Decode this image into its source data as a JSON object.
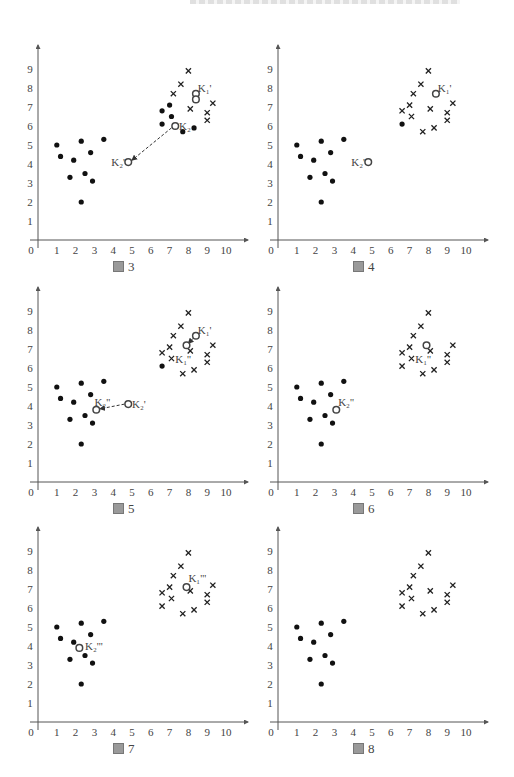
{
  "page": {
    "header_clipped": true
  },
  "panels": [
    {
      "id": "fig3",
      "caption_prefix": "圖",
      "caption_number": "3"
    },
    {
      "id": "fig4",
      "caption_prefix": "圖",
      "caption_number": "4"
    },
    {
      "id": "fig5",
      "caption_prefix": "圖",
      "caption_number": "5"
    },
    {
      "id": "fig6",
      "caption_prefix": "圖",
      "caption_number": "6"
    },
    {
      "id": "fig7",
      "caption_prefix": "圖",
      "caption_number": "7"
    },
    {
      "id": "fig8",
      "caption_prefix": "圖",
      "caption_number": "8"
    }
  ],
  "chart_data": [
    {
      "type": "scatter",
      "title": "圖 3",
      "xlabel": "",
      "ylabel": "",
      "xlim": [
        0,
        11
      ],
      "ylim": [
        0,
        10
      ],
      "x_ticks": [
        "0",
        "1",
        "2",
        "3",
        "4",
        "5",
        "6",
        "7",
        "8",
        "9",
        "10"
      ],
      "y_ticks": [
        "1",
        "2",
        "3",
        "4",
        "5",
        "6",
        "7",
        "8",
        "9"
      ],
      "grid": false,
      "series": [
        {
          "name": "cluster-2 (dot)",
          "marker": "dot",
          "points": [
            [
              1,
              5
            ],
            [
              1.2,
              4.4
            ],
            [
              1.7,
              3.3
            ],
            [
              1.9,
              4.2
            ],
            [
              2.3,
              5.2
            ],
            [
              2.3,
              2
            ],
            [
              2.5,
              3.5
            ],
            [
              2.8,
              4.6
            ],
            [
              2.9,
              3.1
            ],
            [
              3.5,
              5.3
            ],
            [
              6.6,
              6.8
            ],
            [
              6.6,
              6.1
            ],
            [
              7.0,
              7.1
            ],
            [
              7.1,
              6.5
            ],
            [
              7.7,
              5.7
            ],
            [
              8.3,
              5.9
            ]
          ]
        },
        {
          "name": "cluster-1 (cross)",
          "marker": "cross",
          "points": [
            [
              7.2,
              7.7
            ],
            [
              7.6,
              8.2
            ],
            [
              8.0,
              8.9
            ],
            [
              8.1,
              6.9
            ],
            [
              9.0,
              6.7
            ],
            [
              9.0,
              6.3
            ],
            [
              9.3,
              7.2
            ]
          ]
        },
        {
          "name": "centroids",
          "marker": "circle",
          "points": [
            [
              8.4,
              7.7
            ],
            [
              8.4,
              7.4
            ],
            [
              7.3,
              6.0
            ],
            [
              4.8,
              4.1
            ]
          ]
        }
      ],
      "annotations": [
        {
          "text": "K₁'",
          "at": [
            8.5,
            8.0
          ]
        },
        {
          "text": "K₂",
          "at": [
            7.5,
            6.0
          ]
        },
        {
          "text": "K₂'",
          "at": [
            3.9,
            4.1
          ]
        }
      ],
      "arrows": [
        {
          "from": [
            7.1,
            5.9
          ],
          "to": [
            5.0,
            4.2
          ],
          "style": "dashed"
        }
      ]
    },
    {
      "type": "scatter",
      "title": "圖 4",
      "xlim": [
        0,
        11
      ],
      "ylim": [
        0,
        10
      ],
      "x_ticks": [
        "0",
        "1",
        "2",
        "3",
        "4",
        "5",
        "6",
        "7",
        "8",
        "9",
        "10"
      ],
      "y_ticks": [
        "1",
        "2",
        "3",
        "4",
        "5",
        "6",
        "7",
        "8",
        "9"
      ],
      "grid": false,
      "series": [
        {
          "name": "cluster-2 (dot)",
          "marker": "dot",
          "points": [
            [
              1,
              5
            ],
            [
              1.2,
              4.4
            ],
            [
              1.7,
              3.3
            ],
            [
              1.9,
              4.2
            ],
            [
              2.3,
              5.2
            ],
            [
              2.3,
              2
            ],
            [
              2.5,
              3.5
            ],
            [
              2.8,
              4.6
            ],
            [
              2.9,
              3.1
            ],
            [
              3.5,
              5.3
            ],
            [
              6.6,
              6.1
            ]
          ]
        },
        {
          "name": "cluster-1 (cross)",
          "marker": "cross",
          "points": [
            [
              6.6,
              6.8
            ],
            [
              7.0,
              7.1
            ],
            [
              7.1,
              6.5
            ],
            [
              7.2,
              7.7
            ],
            [
              7.6,
              8.2
            ],
            [
              8.0,
              8.9
            ],
            [
              8.1,
              6.9
            ],
            [
              7.7,
              5.7
            ],
            [
              8.3,
              5.9
            ],
            [
              9.0,
              6.7
            ],
            [
              9.0,
              6.3
            ],
            [
              9.3,
              7.2
            ]
          ]
        },
        {
          "name": "centroids",
          "marker": "circle",
          "points": [
            [
              8.4,
              7.7
            ],
            [
              4.8,
              4.1
            ]
          ]
        }
      ],
      "annotations": [
        {
          "text": "K₁'",
          "at": [
            8.5,
            8.0
          ]
        },
        {
          "text": "K₂'",
          "at": [
            3.9,
            4.1
          ]
        }
      ],
      "arrows": []
    },
    {
      "type": "scatter",
      "title": "圖 5",
      "xlim": [
        0,
        11
      ],
      "ylim": [
        0,
        10
      ],
      "x_ticks": [
        "0",
        "1",
        "2",
        "3",
        "4",
        "5",
        "6",
        "7",
        "8",
        "9",
        "10"
      ],
      "y_ticks": [
        "1",
        "2",
        "3",
        "4",
        "5",
        "6",
        "7",
        "8",
        "9"
      ],
      "grid": false,
      "series": [
        {
          "name": "cluster-2 (dot)",
          "marker": "dot",
          "points": [
            [
              1,
              5
            ],
            [
              1.2,
              4.4
            ],
            [
              1.7,
              3.3
            ],
            [
              1.9,
              4.2
            ],
            [
              2.3,
              5.2
            ],
            [
              2.3,
              2
            ],
            [
              2.5,
              3.5
            ],
            [
              2.8,
              4.6
            ],
            [
              2.9,
              3.1
            ],
            [
              3.5,
              5.3
            ],
            [
              6.6,
              6.1
            ]
          ]
        },
        {
          "name": "cluster-1 (cross)",
          "marker": "cross",
          "points": [
            [
              6.6,
              6.8
            ],
            [
              7.0,
              7.1
            ],
            [
              7.1,
              6.5
            ],
            [
              7.2,
              7.7
            ],
            [
              7.6,
              8.2
            ],
            [
              8.0,
              8.9
            ],
            [
              8.1,
              6.9
            ],
            [
              7.7,
              5.7
            ],
            [
              8.3,
              5.9
            ],
            [
              9.0,
              6.7
            ],
            [
              9.0,
              6.3
            ],
            [
              9.3,
              7.2
            ]
          ]
        },
        {
          "name": "centroids",
          "marker": "circle",
          "points": [
            [
              8.4,
              7.7
            ],
            [
              7.9,
              7.2
            ],
            [
              4.8,
              4.1
            ],
            [
              3.1,
              3.8
            ]
          ]
        }
      ],
      "annotations": [
        {
          "text": "K₁'",
          "at": [
            8.5,
            8.0
          ]
        },
        {
          "text": "K₁''",
          "at": [
            7.3,
            6.5
          ]
        },
        {
          "text": "K₂'",
          "at": [
            5.0,
            4.1
          ]
        },
        {
          "text": "K₂''",
          "at": [
            3.0,
            4.2
          ]
        }
      ],
      "arrows": [
        {
          "from": [
            8.3,
            7.6
          ],
          "to": [
            8.0,
            7.3
          ],
          "style": "dashed"
        },
        {
          "from": [
            4.6,
            4.1
          ],
          "to": [
            3.3,
            3.85
          ],
          "style": "dashed"
        }
      ]
    },
    {
      "type": "scatter",
      "title": "圖 6",
      "xlim": [
        0,
        11
      ],
      "ylim": [
        0,
        10
      ],
      "x_ticks": [
        "0",
        "1",
        "2",
        "3",
        "4",
        "5",
        "6",
        "7",
        "8",
        "9",
        "10"
      ],
      "y_ticks": [
        "1",
        "2",
        "3",
        "4",
        "5",
        "6",
        "7",
        "8",
        "9"
      ],
      "grid": false,
      "series": [
        {
          "name": "cluster-2 (dot)",
          "marker": "dot",
          "points": [
            [
              1,
              5
            ],
            [
              1.2,
              4.4
            ],
            [
              1.7,
              3.3
            ],
            [
              1.9,
              4.2
            ],
            [
              2.3,
              5.2
            ],
            [
              2.3,
              2
            ],
            [
              2.5,
              3.5
            ],
            [
              2.8,
              4.6
            ],
            [
              2.9,
              3.1
            ],
            [
              3.5,
              5.3
            ]
          ]
        },
        {
          "name": "cluster-1 (cross)",
          "marker": "cross",
          "points": [
            [
              6.6,
              6.8
            ],
            [
              6.6,
              6.1
            ],
            [
              7.0,
              7.1
            ],
            [
              7.1,
              6.5
            ],
            [
              7.2,
              7.7
            ],
            [
              7.6,
              8.2
            ],
            [
              8.0,
              8.9
            ],
            [
              8.1,
              6.9
            ],
            [
              7.7,
              5.7
            ],
            [
              8.3,
              5.9
            ],
            [
              9.0,
              6.7
            ],
            [
              9.0,
              6.3
            ],
            [
              9.3,
              7.2
            ]
          ]
        },
        {
          "name": "centroids",
          "marker": "circle",
          "points": [
            [
              7.9,
              7.2
            ],
            [
              3.1,
              3.8
            ]
          ]
        }
      ],
      "annotations": [
        {
          "text": "K₁''",
          "at": [
            7.3,
            6.5
          ]
        },
        {
          "text": "K₂''",
          "at": [
            3.2,
            4.2
          ]
        }
      ],
      "arrows": []
    },
    {
      "type": "scatter",
      "title": "圖 7",
      "xlim": [
        0,
        11
      ],
      "ylim": [
        0,
        10
      ],
      "x_ticks": [
        "0",
        "1",
        "2",
        "3",
        "4",
        "5",
        "6",
        "7",
        "8",
        "9",
        "10"
      ],
      "y_ticks": [
        "1",
        "2",
        "3",
        "4",
        "5",
        "6",
        "7",
        "8",
        "9"
      ],
      "grid": false,
      "series": [
        {
          "name": "cluster-2 (dot)",
          "marker": "dot",
          "points": [
            [
              1,
              5
            ],
            [
              1.2,
              4.4
            ],
            [
              1.7,
              3.3
            ],
            [
              1.9,
              4.2
            ],
            [
              2.3,
              5.2
            ],
            [
              2.3,
              2
            ],
            [
              2.5,
              3.5
            ],
            [
              2.8,
              4.6
            ],
            [
              2.9,
              3.1
            ],
            [
              3.5,
              5.3
            ]
          ]
        },
        {
          "name": "cluster-1 (cross)",
          "marker": "cross",
          "points": [
            [
              6.6,
              6.8
            ],
            [
              6.6,
              6.1
            ],
            [
              7.0,
              7.1
            ],
            [
              7.1,
              6.5
            ],
            [
              7.2,
              7.7
            ],
            [
              7.6,
              8.2
            ],
            [
              8.0,
              8.9
            ],
            [
              8.1,
              6.9
            ],
            [
              7.7,
              5.7
            ],
            [
              8.3,
              5.9
            ],
            [
              9.0,
              6.7
            ],
            [
              9.0,
              6.3
            ],
            [
              9.3,
              7.2
            ]
          ]
        },
        {
          "name": "centroids",
          "marker": "circle",
          "points": [
            [
              7.9,
              7.1
            ],
            [
              2.2,
              3.9
            ]
          ]
        }
      ],
      "annotations": [
        {
          "text": "K₁'''",
          "at": [
            8.0,
            7.6
          ]
        },
        {
          "text": "K₂'''",
          "at": [
            2.5,
            4.0
          ]
        }
      ],
      "arrows": []
    },
    {
      "type": "scatter",
      "title": "圖 8",
      "xlim": [
        0,
        11
      ],
      "ylim": [
        0,
        10
      ],
      "x_ticks": [
        "0",
        "1",
        "2",
        "3",
        "4",
        "5",
        "6",
        "7",
        "8",
        "9",
        "10"
      ],
      "y_ticks": [
        "1",
        "2",
        "3",
        "4",
        "5",
        "6",
        "7",
        "8",
        "9"
      ],
      "grid": false,
      "series": [
        {
          "name": "cluster-2 (dot)",
          "marker": "dot",
          "points": [
            [
              1,
              5
            ],
            [
              1.2,
              4.4
            ],
            [
              1.7,
              3.3
            ],
            [
              1.9,
              4.2
            ],
            [
              2.3,
              5.2
            ],
            [
              2.3,
              2
            ],
            [
              2.5,
              3.5
            ],
            [
              2.8,
              4.6
            ],
            [
              2.9,
              3.1
            ],
            [
              3.5,
              5.3
            ]
          ]
        },
        {
          "name": "cluster-1 (cross)",
          "marker": "cross",
          "points": [
            [
              6.6,
              6.8
            ],
            [
              6.6,
              6.1
            ],
            [
              7.0,
              7.1
            ],
            [
              7.1,
              6.5
            ],
            [
              7.2,
              7.7
            ],
            [
              7.6,
              8.2
            ],
            [
              8.0,
              8.9
            ],
            [
              8.1,
              6.9
            ],
            [
              7.7,
              5.7
            ],
            [
              8.3,
              5.9
            ],
            [
              9.0,
              6.7
            ],
            [
              9.0,
              6.3
            ],
            [
              9.3,
              7.2
            ]
          ]
        },
        {
          "name": "centroids",
          "marker": "circle",
          "points": []
        }
      ],
      "annotations": [],
      "arrows": []
    }
  ],
  "layout": {
    "panel_origins": [
      [
        38,
        240
      ],
      [
        278,
        240
      ],
      [
        38,
        482
      ],
      [
        278,
        482
      ],
      [
        38,
        722
      ],
      [
        278,
        722
      ]
    ],
    "unit_x": 18.8,
    "unit_y": 19,
    "axis_len_x": 210,
    "axis_len_y": 195,
    "colors": {
      "axis": "#555555",
      "dot": "#111111",
      "cross": "#222222",
      "circle": "#444444",
      "text": "#444444",
      "arrow": "#333333"
    }
  }
}
